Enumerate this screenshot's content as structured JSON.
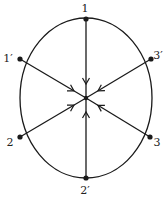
{
  "diagram": {
    "title": "",
    "stroke_color": "#1a1a1a",
    "circle": {
      "cx": 86,
      "cy": 98,
      "r": 80
    },
    "center": {
      "x": 86,
      "y": 98
    },
    "nodes": [
      {
        "id": "1",
        "label": "1",
        "x": 86,
        "y": 19,
        "lx": 85,
        "ly": 12
      },
      {
        "id": "1p",
        "label": "1′",
        "x": 20,
        "y": 59,
        "lx": 8,
        "ly": 62
      },
      {
        "id": "3p",
        "label": "3′",
        "x": 151,
        "y": 59,
        "lx": 158,
        "ly": 59
      },
      {
        "id": "2",
        "label": "2",
        "x": 20,
        "y": 137,
        "lx": 10,
        "ly": 146
      },
      {
        "id": "3",
        "label": "3",
        "x": 150,
        "y": 137,
        "lx": 157,
        "ly": 146
      },
      {
        "id": "2p",
        "label": "2′",
        "x": 86,
        "y": 178,
        "lx": 85,
        "ly": 194
      }
    ],
    "edges_to_center": [
      {
        "from": "1",
        "direction": "inward"
      },
      {
        "from": "1p",
        "direction": "inward"
      },
      {
        "from": "3p",
        "direction": "inward"
      },
      {
        "from": "2",
        "direction": "inward"
      },
      {
        "from": "3",
        "direction": "inward"
      },
      {
        "from": "2p",
        "direction": "inward"
      }
    ]
  }
}
